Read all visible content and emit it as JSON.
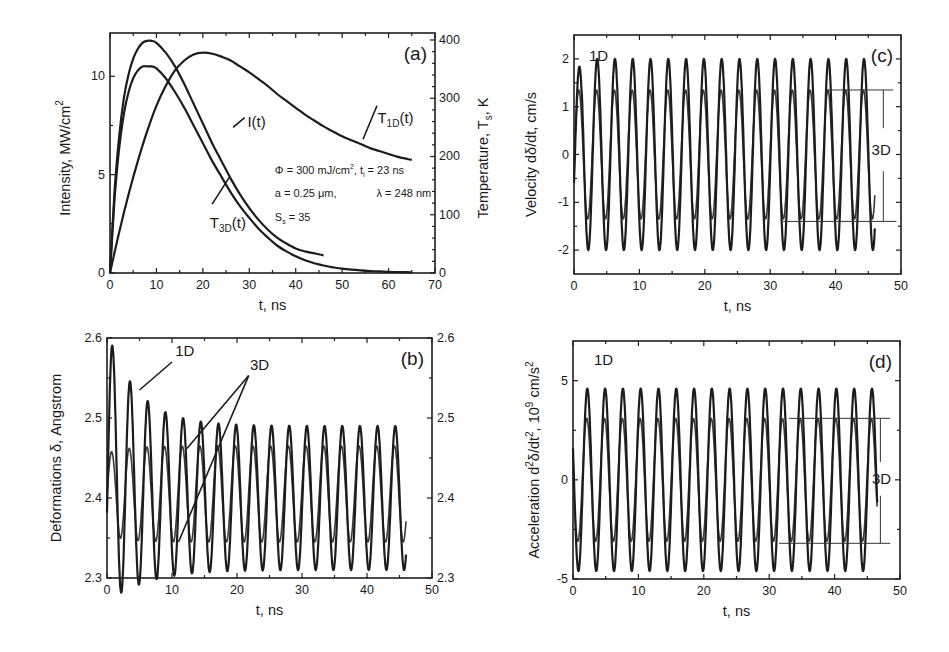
{
  "chart_data": [
    {
      "panel": "a",
      "type": "line",
      "panel_tag": "(a)",
      "xlabel": "t, ns",
      "ylabel": "Intensity, MW/cm",
      "ylabel_sup": "2",
      "ylabel_right": "Temperature, T",
      "ylabel_right_sub": "s",
      "ylabel_right_suffix": ", K",
      "xlim": [
        0,
        70
      ],
      "ylim": [
        0,
        12.2
      ],
      "ylim_right": [
        0,
        412
      ],
      "xticks": [
        0,
        10,
        20,
        30,
        40,
        50,
        60,
        70
      ],
      "yticks": [
        0,
        5,
        10
      ],
      "yticks_right": [
        0,
        100,
        200,
        300,
        400
      ],
      "grid": false,
      "series": [
        {
          "name": "I(t)",
          "label_main": "I(t)",
          "label_sub": "",
          "axis": "left",
          "x": [
            0,
            1,
            2,
            3,
            4,
            5,
            6,
            7,
            8,
            9,
            10,
            12,
            14,
            16,
            18,
            20,
            22,
            24,
            26,
            28,
            30,
            32,
            34,
            36,
            38,
            40,
            42,
            44,
            46
          ],
          "y": [
            0,
            4.2,
            7.0,
            8.9,
            10.1,
            10.9,
            11.4,
            11.7,
            11.8,
            11.8,
            11.7,
            11.2,
            10.5,
            9.6,
            8.6,
            7.6,
            6.6,
            5.7,
            4.8,
            4.0,
            3.3,
            2.7,
            2.2,
            1.8,
            1.5,
            1.25,
            1.1,
            1.0,
            0.9
          ]
        },
        {
          "name": "T3D(t)",
          "label_main": "T",
          "label_sub": "3D",
          "label_suffix": "(t)",
          "axis": "left",
          "x": [
            0,
            1,
            2,
            3,
            4,
            5,
            6,
            7,
            8,
            9,
            10,
            12,
            14,
            16,
            18,
            20,
            22,
            24,
            26,
            28,
            30,
            32,
            34,
            36,
            38,
            40,
            42,
            44,
            46,
            48,
            50,
            52,
            54,
            56,
            58,
            60,
            62,
            64,
            65
          ],
          "y": [
            0,
            3.8,
            6.4,
            8.1,
            9.2,
            9.9,
            10.3,
            10.5,
            10.5,
            10.5,
            10.4,
            9.9,
            9.2,
            8.4,
            7.5,
            6.6,
            5.7,
            4.9,
            4.1,
            3.4,
            2.8,
            2.25,
            1.8,
            1.4,
            1.1,
            0.85,
            0.65,
            0.5,
            0.38,
            0.29,
            0.22,
            0.17,
            0.13,
            0.1,
            0.08,
            0.06,
            0.05,
            0.04,
            0.03
          ]
        },
        {
          "name": "T1D(t)",
          "label_main": "T",
          "label_sub": "1D",
          "label_suffix": "(t)",
          "axis": "left",
          "x": [
            0,
            2,
            4,
            6,
            8,
            10,
            12,
            14,
            16,
            18,
            20,
            22,
            24,
            26,
            28,
            30,
            32,
            34,
            36,
            38,
            40,
            42,
            44,
            46,
            48,
            50,
            52,
            54,
            56,
            58,
            60,
            62,
            64,
            65
          ],
          "y": [
            0,
            2.1,
            4.0,
            5.7,
            7.2,
            8.5,
            9.5,
            10.3,
            10.8,
            11.1,
            11.2,
            11.15,
            11.0,
            10.8,
            10.5,
            10.2,
            9.85,
            9.5,
            9.1,
            8.75,
            8.4,
            8.05,
            7.75,
            7.45,
            7.2,
            6.95,
            6.75,
            6.55,
            6.35,
            6.2,
            6.05,
            5.9,
            5.8,
            5.75
          ]
        }
      ],
      "parameters": {
        "line1_left": "Φ = 300 mJ/cm",
        "line1_sup": "2",
        "line1_mid": ",  t",
        "line1_sub": "i",
        "line1_right": " = 23 ns",
        "line2_left": "a = 0.25 μm,",
        "line2_right": "λ = 248 nm",
        "line3_main": "S",
        "line3_sub": "s",
        "line3_right": " = 35"
      }
    },
    {
      "panel": "b",
      "type": "line",
      "panel_tag": "(b)",
      "xlabel": "t, ns",
      "ylabel": "Deformations δ, Angstrom",
      "xlim": [
        0,
        50
      ],
      "ylim": [
        2.3,
        2.6
      ],
      "xticks": [
        0,
        10,
        20,
        30,
        40,
        50
      ],
      "yticks": [
        2.3,
        2.4,
        2.5,
        2.6
      ],
      "yticks_right": [
        2.3,
        2.4,
        2.5,
        2.6
      ],
      "grid": false,
      "series": [
        {
          "name": "1D",
          "model": "damped-oscillation",
          "t_end": 46,
          "period_ns": 2.72,
          "baseline": 2.4,
          "amplitude_start": 0.17,
          "amplitude_end": 0.09,
          "decay_ns": 5,
          "peaks_approx": [
            2.57,
            2.53,
            2.51,
            2.495,
            2.49,
            2.485,
            2.485,
            2.485,
            2.49,
            2.49,
            2.49,
            2.49,
            2.49,
            2.49,
            2.49,
            2.49,
            2.49
          ],
          "troughs_approx": [
            2.345,
            2.345,
            2.33,
            2.32,
            2.31,
            2.31,
            2.31,
            2.31,
            2.31,
            2.31,
            2.31,
            2.31,
            2.31,
            2.31,
            2.31,
            2.31
          ]
        },
        {
          "name": "3D",
          "model": "oscillation",
          "t_end": 46,
          "period_ns": 2.72,
          "baseline": 2.405,
          "amplitude": 0.06,
          "peaks_approx": 2.465,
          "troughs_approx": 2.345
        }
      ],
      "annotations": [
        {
          "text": "1D"
        },
        {
          "text": "3D"
        }
      ]
    },
    {
      "panel": "c",
      "type": "line",
      "panel_tag": "(c)",
      "xlabel": "t, ns",
      "ylabel": "Velocity dδ/dt, cm/s",
      "xlim": [
        0,
        50
      ],
      "ylim": [
        -2.5,
        2.5
      ],
      "xticks": [
        0,
        10,
        20,
        30,
        40,
        50
      ],
      "yticks": [
        -2,
        -1,
        0,
        1,
        2
      ],
      "grid": false,
      "series": [
        {
          "name": "1D",
          "model": "oscillation",
          "t_end": 46,
          "period_ns": 2.72,
          "amplitude": 2.0,
          "first_peak": 1.8,
          "first_trough": -2.15
        },
        {
          "name": "3D",
          "model": "oscillation",
          "t_end": 46,
          "period_ns": 2.72,
          "amplitude": 1.35
        }
      ],
      "annotations": [
        {
          "text": "1D"
        },
        {
          "text": "3D",
          "bracket_top": 1.35,
          "bracket_bottom": -1.4
        }
      ]
    },
    {
      "panel": "d",
      "type": "line",
      "panel_tag": "(d)",
      "xlabel": "t, ns",
      "ylabel": "Acceleration d",
      "ylabel_sup1": "2",
      "ylabel_mid": "δ/dt",
      "ylabel_sup2": "2",
      "ylabel_mid2": ", 10",
      "ylabel_sup3": "9",
      "ylabel_end": " cm/s",
      "ylabel_sup4": "2",
      "xlim": [
        0,
        50
      ],
      "ylim": [
        -5,
        7
      ],
      "xticks": [
        0,
        10,
        20,
        30,
        40,
        50
      ],
      "yticks": [
        -5,
        0,
        5
      ],
      "grid": false,
      "series": [
        {
          "name": "1D",
          "model": "oscillation",
          "t_end": 46.5,
          "period_ns": 2.72,
          "amplitude": 4.6
        },
        {
          "name": "3D",
          "model": "oscillation",
          "t_end": 46.5,
          "period_ns": 2.72,
          "amplitude": 3.1
        }
      ],
      "annotations": [
        {
          "text": "1D"
        },
        {
          "text": "3D",
          "bracket_top": 3.1,
          "bracket_bottom": -3.2
        }
      ]
    }
  ]
}
